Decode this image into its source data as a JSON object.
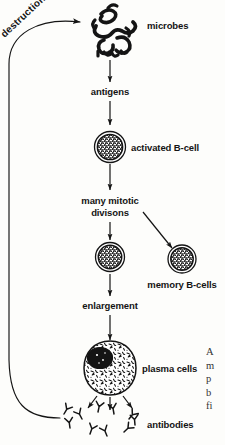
{
  "diagram": {
    "background_color": "#fdfdfb",
    "ink_color": "#141414",
    "labels": {
      "destruction": "destruction",
      "microbes": "microbes",
      "antigens": "antigens",
      "activated_bcell": "activated B-cell",
      "mitosis_line1": "many mitotic",
      "mitosis_line2": "divisons",
      "memory_bcells": "memory B-cells",
      "enlargement": "enlargement",
      "plasma_cells": "plasma cells",
      "antibodies": "antibodies"
    },
    "margin_note_fragment": "A\nm\np\nb\nfi",
    "nodes": [
      {
        "name": "microbes",
        "kind": "squiggle-cluster",
        "label": "microbes"
      },
      {
        "name": "antigens",
        "kind": "text-node",
        "label": "antigens"
      },
      {
        "name": "activated-b-cell",
        "kind": "stippled-cell",
        "label": "activated B-cell"
      },
      {
        "name": "mitotic-divisions",
        "kind": "text-node",
        "label": "many mitotic divisons"
      },
      {
        "name": "daughter-b-cell",
        "kind": "stippled-cell",
        "label": ""
      },
      {
        "name": "memory-b-cells",
        "kind": "stippled-cell",
        "label": "memory B-cells"
      },
      {
        "name": "enlargement",
        "kind": "text-node",
        "label": "enlargement"
      },
      {
        "name": "plasma-cell",
        "kind": "plasma-cell",
        "label": "plasma cells"
      },
      {
        "name": "antibodies",
        "kind": "antibody-cluster",
        "label": "antibodies"
      }
    ],
    "flow_edges": [
      {
        "from": "antibodies",
        "to": "microbes",
        "label": "destruction",
        "style": "curved"
      },
      {
        "from": "microbes",
        "to": "antigens",
        "label": "",
        "style": "straight"
      },
      {
        "from": "antigens",
        "to": "activated-b-cell",
        "label": "",
        "style": "straight"
      },
      {
        "from": "activated-b-cell",
        "to": "mitotic-divisions",
        "label": "",
        "style": "straight"
      },
      {
        "from": "mitotic-divisions",
        "to": "daughter-b-cell",
        "label": "",
        "style": "straight"
      },
      {
        "from": "mitotic-divisions",
        "to": "memory-b-cells",
        "label": "",
        "style": "diagonal"
      },
      {
        "from": "daughter-b-cell",
        "to": "enlargement",
        "label": "",
        "style": "straight"
      },
      {
        "from": "enlargement",
        "to": "plasma-cell",
        "label": "",
        "style": "straight"
      },
      {
        "from": "plasma-cell",
        "to": "antibodies",
        "label": "",
        "style": "fan"
      }
    ]
  }
}
